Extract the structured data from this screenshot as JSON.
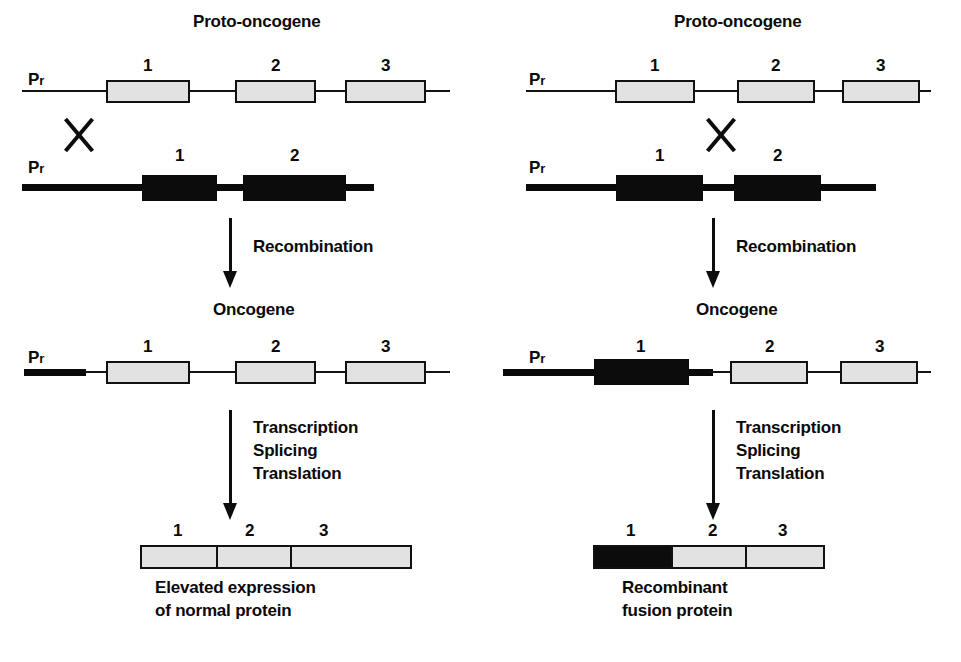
{
  "figure": {
    "title_left": "Proto-oncogene",
    "title_right": "Proto-oncogene"
  },
  "panels": {
    "left": {
      "proto_title": "Proto-oncogene",
      "proto_promoter": "Pr",
      "proto_exons": [
        "1",
        "2",
        "3"
      ],
      "retro_promoter": "Pr",
      "retro_exons": [
        "1",
        "2"
      ],
      "crossover_symbol": "X",
      "recombination_label": "Recombination",
      "oncogene_title": "Oncogene",
      "oncogene_promoter": "Pr",
      "oncogene_exons": [
        "1",
        "2",
        "3"
      ],
      "process_steps": [
        "Transcription",
        "Splicing",
        "Translation"
      ],
      "protein_exons": [
        "1",
        "2",
        "3"
      ],
      "caption_line1": "Elevated expression",
      "caption_line2": "of normal protein"
    },
    "right": {
      "proto_title": "Proto-oncogene",
      "proto_promoter": "Pr",
      "proto_exons": [
        "1",
        "2",
        "3"
      ],
      "retro_promoter": "Pr",
      "retro_exons": [
        "1",
        "2"
      ],
      "crossover_symbol": "X",
      "recombination_label": "Recombination",
      "oncogene_title": "Oncogene",
      "oncogene_promoter": "Pr",
      "oncogene_exons": [
        "1",
        "2",
        "3"
      ],
      "process_steps": [
        "Transcription",
        "Splicing",
        "Translation"
      ],
      "protein_exons": [
        "1",
        "2",
        "3"
      ],
      "caption_line1": "Recombinant",
      "caption_line2": "fusion protein"
    }
  },
  "colors": {
    "ink": "#0c0c0c",
    "exon_fill": "#e2e2e2",
    "viral_fill": "#0c0c0c",
    "background": "#ffffff"
  }
}
